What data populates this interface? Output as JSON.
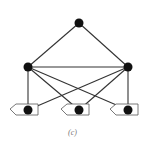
{
  "caption": "(c)",
  "colors": {
    "node": "#111111",
    "edge": "#333333",
    "shape_stroke": "#555555"
  },
  "nodes": [
    {
      "id": "top",
      "x": 79,
      "y": 23
    },
    {
      "id": "mid-left",
      "x": 28,
      "y": 67
    },
    {
      "id": "mid-right",
      "x": 128,
      "y": 67
    },
    {
      "id": "bottom-left",
      "x": 28,
      "y": 110,
      "marker": "pentagon"
    },
    {
      "id": "bottom-mid",
      "x": 79,
      "y": 110,
      "marker": "pentagon"
    },
    {
      "id": "bottom-right",
      "x": 128,
      "y": 110,
      "marker": "pentagon"
    }
  ],
  "edges": [
    [
      "top",
      "mid-left"
    ],
    [
      "top",
      "mid-right"
    ],
    [
      "mid-left",
      "mid-right"
    ],
    [
      "mid-left",
      "bottom-left"
    ],
    [
      "mid-left",
      "bottom-mid"
    ],
    [
      "mid-left",
      "bottom-right"
    ],
    [
      "mid-right",
      "bottom-left"
    ],
    [
      "mid-right",
      "bottom-mid"
    ],
    [
      "mid-right",
      "bottom-right"
    ]
  ]
}
